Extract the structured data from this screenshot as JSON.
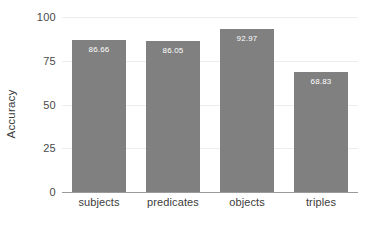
{
  "chart_data": {
    "type": "bar",
    "title": "",
    "xlabel": "",
    "ylabel": "Accuracy",
    "categories": [
      "subjects",
      "predicates",
      "objects",
      "triples"
    ],
    "values": [
      86.66,
      86.05,
      92.97,
      68.83
    ],
    "value_labels": [
      "86.66",
      "86.05",
      "92.97",
      "68.83"
    ],
    "ylim": [
      0,
      100
    ],
    "yticks": [
      0,
      25,
      50,
      75,
      100
    ],
    "ytick_labels": [
      "0",
      "25",
      "50",
      "75",
      "100"
    ],
    "grid": true,
    "legend": false,
    "bar_color": "#808080",
    "gridline_color": "#ededf0",
    "axis_color": "#9a9a9a",
    "value_label_color": "#ffffff",
    "tick_label_color": "#4a4a4a",
    "background": "#ffffff"
  }
}
